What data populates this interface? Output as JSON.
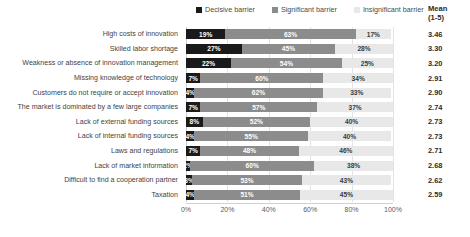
{
  "legend": {
    "position": "top",
    "items": [
      {
        "label": "Decisive barrier",
        "color": "#1a1a1a",
        "icon": "square-marker-icon"
      },
      {
        "label": "Significant barrier",
        "color": "#8c8c8c",
        "icon": "square-marker-icon"
      },
      {
        "label": "Insignificant barrier",
        "color": "#e8e8e8",
        "icon": "square-marker-icon"
      }
    ]
  },
  "mean_column": {
    "header_line1": "Mean",
    "header_line2": "(1-5)",
    "values": [
      "3.46",
      "3.30",
      "3.20",
      "2.91",
      "2.90",
      "2.74",
      "2.73",
      "2.73",
      "2.71",
      "2.68",
      "2.62",
      "2.59"
    ]
  },
  "axis": {
    "ticks": [
      "0%",
      "20%",
      "40%",
      "60%",
      "80%",
      "100%"
    ],
    "tick_values": [
      0,
      20,
      40,
      60,
      80,
      100
    ]
  },
  "bar_labels": {
    "decisive": [
      "19%",
      "27%",
      "22%",
      "7%",
      "4%",
      "7%",
      "8%",
      "4%",
      "7%",
      "2%",
      "3%",
      "4%"
    ],
    "significant": [
      "63%",
      "45%",
      "54%",
      "60%",
      "62%",
      "57%",
      "52%",
      "55%",
      "48%",
      "60%",
      "53%",
      "51%"
    ],
    "insignificant": [
      "17%",
      "28%",
      "25%",
      "34%",
      "33%",
      "37%",
      "40%",
      "40%",
      "46%",
      "38%",
      "43%",
      "45%"
    ]
  },
  "chart_data": {
    "type": "bar",
    "orientation": "horizontal",
    "stacked": true,
    "stack_mode": "percent",
    "title": "",
    "subtitle": "",
    "xlabel": "",
    "ylabel": "",
    "xlim": [
      0,
      100
    ],
    "grid": true,
    "grid_axis": "x",
    "legend_position": "top",
    "categories": [
      "High costs of innovation",
      "Skilled labor shortage",
      "Weakness or absence of innovation management",
      "Missing knowledge of technology",
      "Customers do not require or accept innovation",
      "The market is dominated by a few large companies",
      "Lack of external funding sources",
      "Lack of internal funding sources",
      "Laws and regulations",
      "Lack of market information",
      "Difficult to find a cooperation partner",
      "Taxation"
    ],
    "series": [
      {
        "name": "Decisive barrier",
        "color": "#1a1a1a",
        "values": [
          19,
          27,
          22,
          7,
          4,
          7,
          8,
          4,
          7,
          2,
          3,
          4
        ]
      },
      {
        "name": "Significant barrier",
        "color": "#8c8c8c",
        "values": [
          63,
          45,
          54,
          60,
          62,
          57,
          52,
          55,
          48,
          60,
          53,
          51
        ]
      },
      {
        "name": "Insignificant barrier",
        "color": "#e8e8e8",
        "values": [
          17,
          28,
          25,
          34,
          33,
          37,
          40,
          40,
          46,
          38,
          43,
          45
        ]
      }
    ],
    "annotations": {
      "mean_1_to_5": [
        3.46,
        3.3,
        3.2,
        2.91,
        2.9,
        2.74,
        2.73,
        2.73,
        2.71,
        2.68,
        2.62,
        2.59
      ]
    }
  }
}
